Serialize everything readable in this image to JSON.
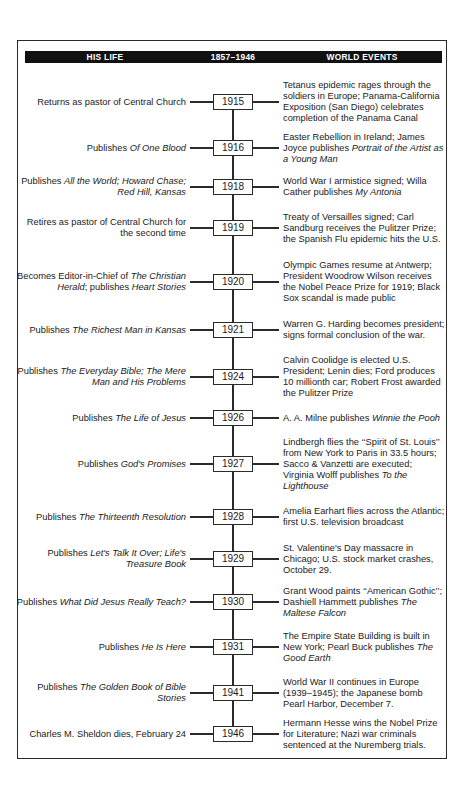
{
  "header": {
    "left_label": "HIS LIFE",
    "center_label": "1857–1946",
    "right_label": "WORLD EVENTS"
  },
  "timeline": [
    {
      "year": "1915",
      "y": 102,
      "life": [
        {
          "t": "Returns as pastor of Central Church"
        }
      ],
      "events": [
        {
          "t": "Tetanus epidemic rages through the soldiers in Europe; Panama-California Exposition (San Diego) celebrates completion of the Panama Canal"
        }
      ]
    },
    {
      "year": "1916",
      "y": 148,
      "life": [
        {
          "t": "Publishes "
        },
        {
          "t": "Of One Blood",
          "i": true
        }
      ],
      "events": [
        {
          "t": "Easter Rebellion in Ireland; James Joyce publishes "
        },
        {
          "t": "Portrait of the Artist as a Young Man",
          "i": true
        }
      ]
    },
    {
      "year": "1918",
      "y": 187,
      "life": [
        {
          "t": "Publishes "
        },
        {
          "t": "All the World; Howard Chase; Red Hill, Kansas",
          "i": true
        }
      ],
      "events": [
        {
          "t": "World War I armistice signed; Willa Cather publishes "
        },
        {
          "t": "My Antonia",
          "i": true
        }
      ]
    },
    {
      "year": "1919",
      "y": 228,
      "life": [
        {
          "t": "Retires as pastor of Central Church for the second time"
        }
      ],
      "events": [
        {
          "t": "Treaty of Versailles signed; Carl Sandburg receives the Pulitzer Prize; the Spanish Flu epidemic hits the U.S."
        }
      ]
    },
    {
      "year": "1920",
      "y": 282,
      "life": [
        {
          "t": "Becomes Editor-in-Chief of "
        },
        {
          "t": "The Christian Herald",
          "i": true
        },
        {
          "t": "; publishes "
        },
        {
          "t": "Heart Stories",
          "i": true
        }
      ],
      "events": [
        {
          "t": "Olympic Games resume at Antwerp; President Woodrow Wilson receives the Nobel Peace Prize for 1919; Black Sox scandal is made public"
        }
      ]
    },
    {
      "year": "1921",
      "y": 330,
      "life": [
        {
          "t": "Publishes "
        },
        {
          "t": "The Richest Man in Kansas",
          "i": true
        }
      ],
      "events": [
        {
          "t": "Warren G. Harding becomes president; signs formal conclusion of the war."
        }
      ]
    },
    {
      "year": "1924",
      "y": 377,
      "life": [
        {
          "t": "Publishes "
        },
        {
          "t": "The Everyday Bible; The Mere Man and His Problems",
          "i": true
        }
      ],
      "events": [
        {
          "t": "Calvin Coolidge is elected U.S. President; Lenin dies; Ford produces 10 millionth car; Robert Frost awarded the Pulitzer Prize"
        }
      ]
    },
    {
      "year": "1926",
      "y": 418,
      "life": [
        {
          "t": "Publishes "
        },
        {
          "t": "The Life of Jesus",
          "i": true
        }
      ],
      "events": [
        {
          "t": "A. A. Milne publishes "
        },
        {
          "t": "Winnie the Pooh",
          "i": true
        }
      ]
    },
    {
      "year": "1927",
      "y": 464,
      "life": [
        {
          "t": "Publishes "
        },
        {
          "t": "God's Promises",
          "i": true
        }
      ],
      "events": [
        {
          "t": "Lindbergh flies the ‘‘Spirit of St. Louis’’ from New York to Paris in 33.5 hours; Sacco & Vanzetti are executed; Virginia Wolff publishes "
        },
        {
          "t": "To the Lighthouse",
          "i": true
        }
      ]
    },
    {
      "year": "1928",
      "y": 517,
      "life": [
        {
          "t": "Publishes "
        },
        {
          "t": "The Thirteenth Resolution",
          "i": true
        }
      ],
      "events": [
        {
          "t": "Amelia Earhart flies across the Atlantic; first U.S. television broadcast"
        }
      ]
    },
    {
      "year": "1929",
      "y": 559,
      "life": [
        {
          "t": "Publishes "
        },
        {
          "t": "Let's Talk It Over; Life's Treasure Book",
          "i": true
        }
      ],
      "events": [
        {
          "t": "St. Valentine's Day massacre in Chicago; U.S. stock market crashes, October 29."
        }
      ]
    },
    {
      "year": "1930",
      "y": 602,
      "life": [
        {
          "t": "Publishes "
        },
        {
          "t": "What Did Jesus Really Teach?",
          "i": true
        }
      ],
      "events": [
        {
          "t": "Grant Wood paints ‘‘American Gothic’’; Dashiell Hammett publishes "
        },
        {
          "t": "The Maltese Falcon",
          "i": true
        }
      ]
    },
    {
      "year": "1931",
      "y": 647,
      "life": [
        {
          "t": "Publishes "
        },
        {
          "t": "He Is Here",
          "i": true
        }
      ],
      "events": [
        {
          "t": "The Empire State Building is built in New York; Pearl Buck publishes "
        },
        {
          "t": "The Good Earth",
          "i": true
        }
      ]
    },
    {
      "year": "1941",
      "y": 693,
      "life": [
        {
          "t": "Publishes "
        },
        {
          "t": "The Golden Book of Bible Stories",
          "i": true
        }
      ],
      "events": [
        {
          "t": "World War II continues in Europe (1939–1945); the Japanese bomb Pearl Harbor, December 7."
        }
      ]
    },
    {
      "year": "1946",
      "y": 734,
      "life": [
        {
          "t": "Charles M. Sheldon dies, February 24"
        }
      ],
      "events": [
        {
          "t": "Hermann Hesse wins the Nobel Prize for Literature; Nazi war criminals sentenced at the Nuremberg trials."
        }
      ]
    }
  ]
}
